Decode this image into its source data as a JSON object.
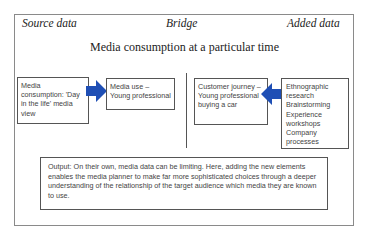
{
  "headers": {
    "source": "Source data",
    "bridge": "Bridge",
    "added": "Added data"
  },
  "title": "Media consumption at a particular time",
  "boxes": {
    "media_consumption": "Media consumption: 'Day in the life' media view",
    "media_use": "Media use – Young professional",
    "customer_journey": "Customer journey – Young professional buying a car",
    "added_methods": "Ethnographic research Brainstorming Experience workshops Company processes"
  },
  "output": "Output: On their own, media data can be limiting. Here, adding the new elements enables the media planner to make far more sophisticated choices through a deeper understanding of the relationship of the target audience which media they are known to use.",
  "colors": {
    "arrow": "#1f4fb5"
  }
}
